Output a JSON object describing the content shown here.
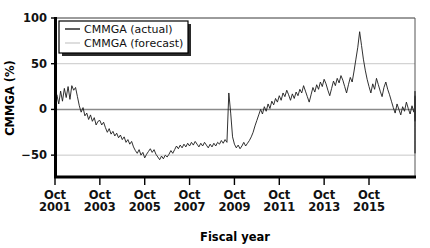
{
  "chart_data": {
    "type": "line",
    "title": "",
    "xlabel": "Fiscal year",
    "ylabel": "CMMGA (%)",
    "ylim": [
      -75,
      100
    ],
    "yticks": [
      100,
      50,
      0,
      -50
    ],
    "ytick_labels": [
      "100",
      "50",
      "0",
      "−50"
    ],
    "xlim": [
      "Oct 2001",
      "Oct 2016"
    ],
    "xticks": [
      "Oct 2001",
      "Oct 2003",
      "Oct 2005",
      "Oct 2007",
      "Oct 2009",
      "Oct 2011",
      "Oct 2013",
      "Oct 2015"
    ],
    "xtick_labels": [
      {
        "month": "Oct",
        "year": "2001"
      },
      {
        "month": "Oct",
        "year": "2003"
      },
      {
        "month": "Oct",
        "year": "2005"
      },
      {
        "month": "Oct",
        "year": "2007"
      },
      {
        "month": "Oct",
        "year": "2009"
      },
      {
        "month": "Oct",
        "year": "2011"
      },
      {
        "month": "Oct",
        "year": "2013"
      },
      {
        "month": "Oct",
        "year": "2015"
      }
    ],
    "grid": true,
    "gridlines_y": [
      100,
      50,
      0,
      -50
    ],
    "legend_position": "top-left",
    "legend": [
      {
        "name": "CMMGA (actual)",
        "color": "#1a1a1a"
      },
      {
        "name": "CMMGA (forecast)",
        "color": "#d0d0d0"
      }
    ],
    "series": [
      {
        "name": "CMMGA (actual)",
        "color": "#1a1a1a",
        "x_start": "Oct 2001",
        "x_step_months": 1,
        "values": [
          10,
          16,
          6,
          20,
          9,
          23,
          13,
          25,
          11,
          26,
          21,
          24,
          14,
          4,
          -3,
          2,
          -7,
          -4,
          -11,
          -6,
          -13,
          -9,
          -17,
          -13,
          -12,
          -17,
          -14,
          -20,
          -25,
          -21,
          -27,
          -24,
          -29,
          -26,
          -31,
          -28,
          -33,
          -30,
          -36,
          -33,
          -38,
          -35,
          -41,
          -45,
          -48,
          -44,
          -50,
          -47,
          -53,
          -49,
          -46,
          -43,
          -47,
          -44,
          -49,
          -52,
          -55,
          -51,
          -54,
          -50,
          -52,
          -49,
          -45,
          -48,
          -44,
          -40,
          -43,
          -39,
          -42,
          -38,
          -41,
          -37,
          -40,
          -36,
          -39,
          -35,
          -38,
          -41,
          -37,
          -40,
          -36,
          -39,
          -42,
          -38,
          -41,
          -37,
          -40,
          -36,
          -38,
          -34,
          -37,
          -33,
          -36,
          18,
          -4,
          -30,
          -38,
          -42,
          -39,
          -43,
          -40,
          -36,
          -40,
          -37,
          -34,
          -30,
          -25,
          -18,
          -12,
          -6,
          0,
          -5,
          3,
          -2,
          6,
          1,
          9,
          5,
          12,
          8,
          15,
          10,
          18,
          14,
          21,
          16,
          10,
          17,
          12,
          19,
          15,
          22,
          18,
          26,
          20,
          14,
          8,
          16,
          24,
          19,
          27,
          22,
          30,
          25,
          33,
          28,
          21,
          15,
          23,
          31,
          26,
          34,
          29,
          37,
          32,
          25,
          18,
          27,
          35,
          30,
          42,
          55,
          68,
          85,
          70,
          55,
          43,
          33,
          25,
          18,
          28,
          22,
          34,
          27,
          20,
          14,
          24,
          30,
          22,
          16,
          9,
          2,
          -4,
          6,
          0,
          -6,
          3,
          -2,
          8,
          1,
          -5,
          4,
          -3,
          7,
          0,
          -7,
          2,
          -4,
          9,
          3,
          -2,
          6,
          -1,
          -8,
          -3,
          5,
          11,
          4,
          -2,
          -9,
          -4,
          2,
          8,
          14,
          7,
          0,
          -6,
          -13,
          -7,
          0,
          6,
          13,
          20,
          12,
          5,
          -2,
          -10,
          -20,
          -34,
          -48,
          -38,
          -26,
          -14,
          -5,
          3,
          -3,
          4,
          -2,
          5,
          -4,
          2,
          9,
          15,
          8,
          1,
          -6,
          -12,
          -5,
          2,
          -3,
          4,
          -2,
          0,
          3,
          -1,
          2,
          0,
          1,
          -1,
          0,
          2,
          -1,
          1,
          0
        ]
      },
      {
        "name": "CMMGA (forecast)",
        "color": "#d0d0d0",
        "x_start": "Oct 2001",
        "x_step_months": 1,
        "values": []
      }
    ],
    "annotations": []
  },
  "axes": {
    "y_title": "CMMGA (%)",
    "x_title": "Fiscal year"
  },
  "colors": {
    "line_actual": "#1a1a1a",
    "line_forecast": "#d0d0d0",
    "axis": "#000000",
    "gridline": "#c8c8c8",
    "zero_line": "#8a8a8a",
    "background": "#ffffff",
    "legend_border": "#000000",
    "legend_shadow": "#2a2a2a"
  }
}
